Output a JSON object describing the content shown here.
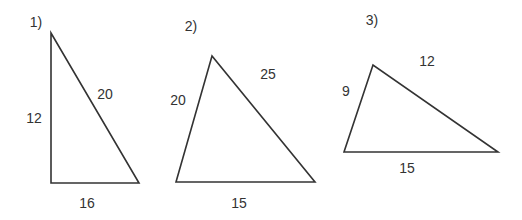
{
  "diagram": {
    "stroke_color": "#333333",
    "triangles": [
      {
        "number_label": "1)",
        "vertices": [
          [
            51,
            33
          ],
          [
            51,
            183
          ],
          [
            139,
            183
          ]
        ],
        "sides": {
          "left": "12",
          "hypotenuse": "20",
          "bottom": "16"
        }
      },
      {
        "number_label": "2)",
        "vertices": [
          [
            212,
            56
          ],
          [
            176,
            182
          ],
          [
            315,
            182
          ]
        ],
        "sides": {
          "left": "20",
          "right": "25",
          "bottom": "15"
        }
      },
      {
        "number_label": "3)",
        "vertices": [
          [
            373,
            65
          ],
          [
            344,
            152
          ],
          [
            498,
            152
          ]
        ],
        "sides": {
          "left": "9",
          "right": "12",
          "bottom": "15"
        }
      }
    ]
  }
}
